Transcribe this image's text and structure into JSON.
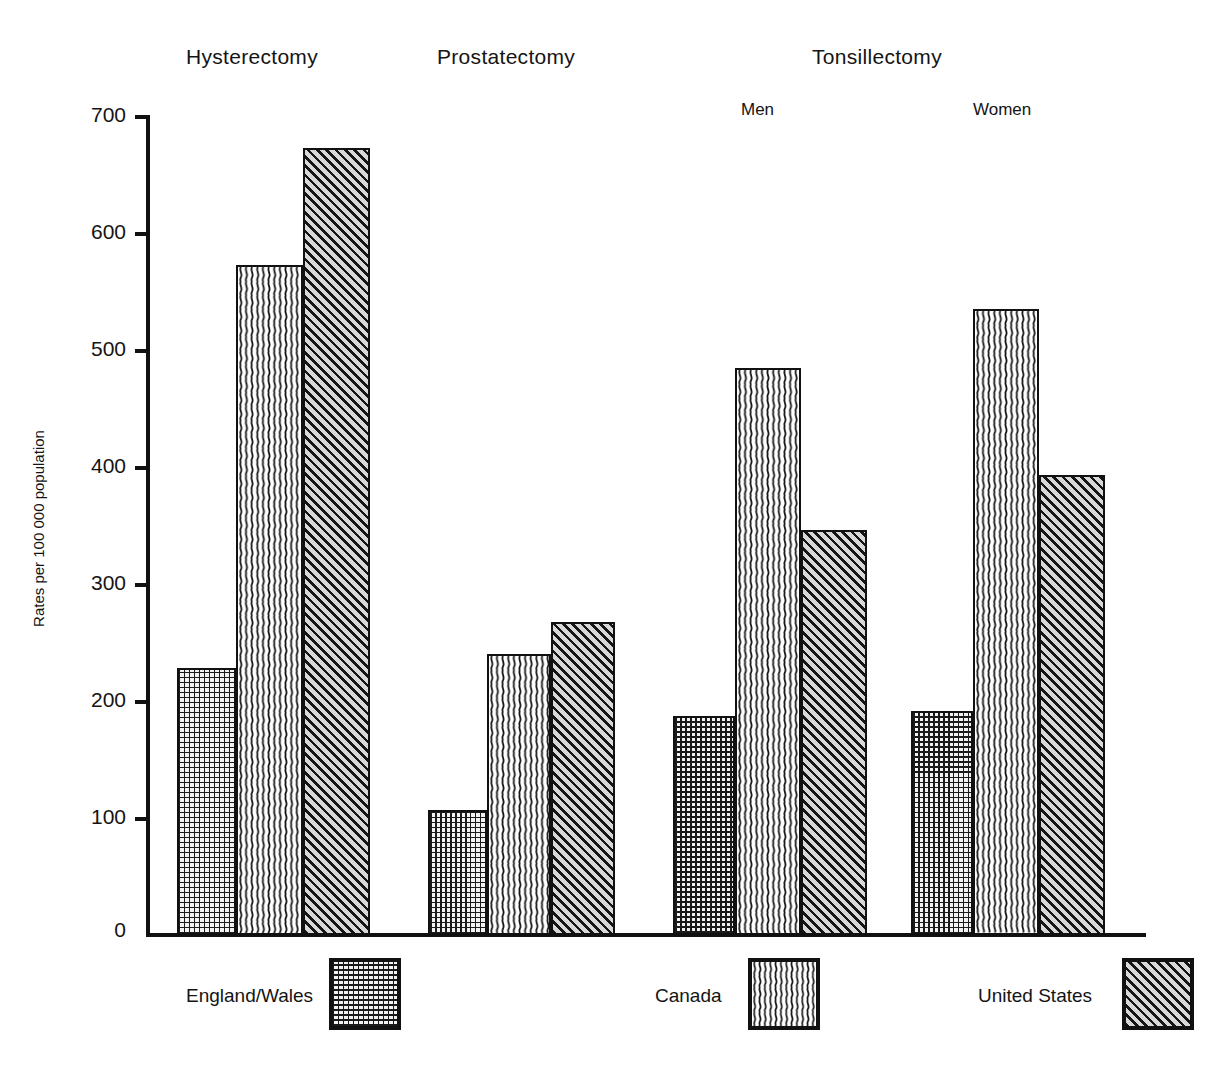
{
  "chart_data": {
    "type": "bar",
    "title": "",
    "xlabel": "",
    "ylabel": "Rates per 100 000 population",
    "ylim": [
      0,
      700
    ],
    "ytick_values": [
      0,
      100,
      200,
      300,
      400,
      500,
      600,
      700
    ],
    "ytick_labels": [
      "0",
      "100",
      "200",
      "300",
      "400",
      "500",
      "600",
      "700"
    ],
    "grid": false,
    "legend_position": "bottom",
    "categories": [
      "Hysterectomy",
      "Prostatectomy",
      "Tonsillectomy Men",
      "Tonsillectomy Women"
    ],
    "series": [
      {
        "name": "England/Wales",
        "pattern": "dotted-grid",
        "values": [
          228,
          107,
          187,
          191
        ]
      },
      {
        "name": "Canada",
        "pattern": "wavy-vertical-lines",
        "values": [
          572,
          240,
          484,
          534
        ]
      },
      {
        "name": "United States",
        "pattern": "diagonal-hatch",
        "values": [
          672,
          267,
          346,
          393
        ]
      }
    ],
    "group_titles": [
      {
        "label": "Hysterectomy"
      },
      {
        "label": "Prostatectomy"
      },
      {
        "label": "Tonsillectomy"
      }
    ],
    "group_subtitles": [
      {
        "label": "Men"
      },
      {
        "label": "Women"
      }
    ],
    "annotations": []
  },
  "legend": {
    "items": [
      {
        "label": "England/Wales",
        "pattern": "dotted-grid"
      },
      {
        "label": "Canada",
        "pattern": "wavy-vertical-lines"
      },
      {
        "label": "United States",
        "pattern": "diagonal-hatch"
      }
    ]
  }
}
